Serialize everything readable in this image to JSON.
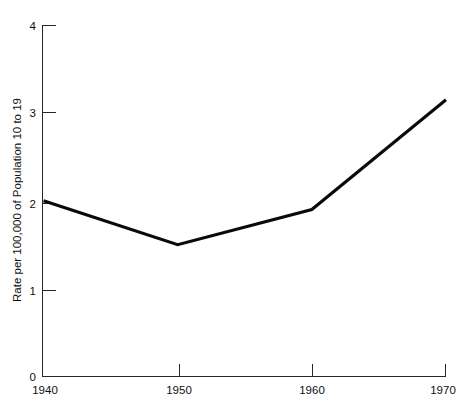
{
  "chart_data": {
    "type": "line",
    "title": "",
    "subtitle": "",
    "xlabel": "",
    "ylabel": "Rate per 100,000 of Population 10 to 19",
    "x": [
      1940,
      1950,
      1960,
      1970
    ],
    "values": [
      2.0,
      1.5,
      1.9,
      3.15
    ],
    "series": [
      {
        "name": "Rate",
        "values": [
          2.0,
          1.5,
          1.9,
          3.15
        ],
        "color": "#0a0a0a"
      }
    ],
    "xlim": [
      1940,
      1970
    ],
    "ylim": [
      0,
      4
    ],
    "xticks": [
      1940,
      1950,
      1960,
      1970
    ],
    "xtick_labels": [
      "1940",
      "1950",
      "1960",
      "1970"
    ],
    "yticks": [
      0,
      1,
      2,
      3,
      4
    ],
    "ytick_labels": [
      "0",
      "1",
      "2",
      "3",
      "4"
    ],
    "grid": false,
    "legend": false,
    "legend_position": "none",
    "annotations": []
  },
  "axes": {
    "y_title": "Rate per 100,000 of Population 10 to 19",
    "y_labels": {
      "t0": "0",
      "t1": "1",
      "t2": "2",
      "t3": "3",
      "t4": "4"
    },
    "x_labels": {
      "t0": "1940",
      "t1": "1950",
      "t2": "1960",
      "t3": "1970"
    }
  },
  "colors": {
    "background": "#ffffff",
    "axis": "#262626",
    "series": "#0a0a0a",
    "text": "#101010"
  }
}
